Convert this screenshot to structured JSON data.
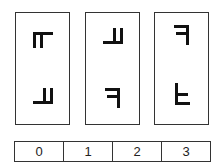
{
  "cards": [
    {
      "index": 0,
      "top_glyph": "e-rotated-down",
      "bottom_glyph": "e-rotated-up"
    },
    {
      "index": 1,
      "top_glyph": "e-rotated-up",
      "bottom_glyph": "f-mirrored"
    },
    {
      "index": 2,
      "top_glyph": "f-mirrored",
      "bottom_glyph": "f-flipped"
    }
  ],
  "answer_strip": {
    "options": [
      "0",
      "1",
      "2",
      "3"
    ]
  },
  "colors": {
    "stroke": "#333333",
    "glyph": "#111111",
    "background": "#ffffff"
  }
}
